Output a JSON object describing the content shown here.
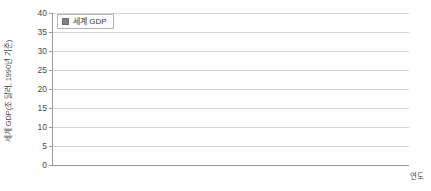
{
  "chart_data": {
    "type": "bar",
    "title": "",
    "categories": [
      "1500",
      "1600",
      "1700",
      "1820",
      "1870",
      "1913",
      "1950",
      "1973",
      "1998"
    ],
    "values": [
      0.25,
      0.33,
      0.37,
      0.7,
      1.1,
      2.7,
      5.3,
      16.0,
      33.7
    ],
    "series": [
      {
        "name": "세계 GDP",
        "values": [
          0.25,
          0.33,
          0.37,
          0.7,
          1.1,
          2.7,
          5.3,
          16.0,
          33.7
        ]
      }
    ],
    "xlabel": "연도",
    "ylabel": "세계 GDP(조 달러, 1990년 기준)",
    "ylim": [
      0,
      40
    ],
    "yticks": [
      0,
      5,
      10,
      15,
      20,
      25,
      30,
      35,
      40
    ],
    "grid": true,
    "legend_position": "top-left",
    "bar_color": "#808080",
    "grid_color": "#d6d6d6",
    "axis_color": "#9a9a9a"
  },
  "legend": {
    "entries": [
      {
        "label": "세계 GDP",
        "color": "#808080",
        "marker": "filled-square-marker"
      }
    ]
  }
}
